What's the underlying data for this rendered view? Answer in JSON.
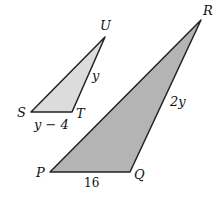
{
  "diagram": {
    "small_triangle": {
      "vertices": [
        {
          "name": "S",
          "x": 31,
          "y": 112
        },
        {
          "name": "T",
          "x": 72,
          "y": 112
        },
        {
          "name": "U",
          "x": 105,
          "y": 37
        }
      ],
      "fill": "#dcdcdc",
      "labels": {
        "S": "S",
        "T": "T",
        "U": "U"
      },
      "sides": {
        "ST": "y − 4",
        "TU": "y"
      }
    },
    "large_triangle": {
      "vertices": [
        {
          "name": "P",
          "x": 50,
          "y": 172
        },
        {
          "name": "Q",
          "x": 130,
          "y": 172
        },
        {
          "name": "R",
          "x": 201,
          "y": 20
        }
      ],
      "fill": "#b4b4b4",
      "labels": {
        "P": "P",
        "Q": "Q",
        "R": "R"
      },
      "sides": {
        "PQ": "16",
        "QR": "2y"
      }
    },
    "stroke": "#222222"
  }
}
